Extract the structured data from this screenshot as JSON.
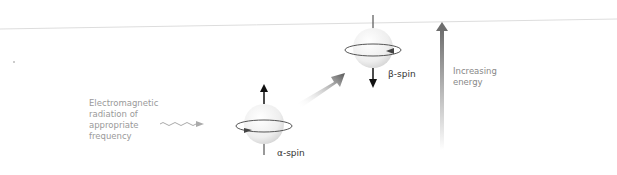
{
  "diagram": {
    "radiation_label": "Electromagnetic radiation of appropriate frequency",
    "radiation_lines": [
      "Electromagnetic",
      "radiation of",
      "appropriate",
      "frequency"
    ],
    "lower_state_label": "α-spin",
    "upper_state_label": "β-spin",
    "energy_axis_lines": [
      "Increasing",
      "energy"
    ],
    "caption_fragment": "",
    "colors": {
      "baseline": "#d9d9d9",
      "sphere_fill": "#f2f2f2",
      "spin_arrow": "#111111",
      "orbit_ring": "#555555",
      "energy_arrow": "#7a7a7a",
      "transition_arrow": "#666666",
      "wave": "#aaaaaa",
      "muted_text": "#9a9a9a"
    },
    "nodes": [
      {
        "id": "alpha-spin",
        "label": "α-spin",
        "spin_direction": "up",
        "level": "lower"
      },
      {
        "id": "beta-spin",
        "label": "β-spin",
        "spin_direction": "down",
        "level": "upper"
      }
    ],
    "edges": [
      {
        "from": "radiation",
        "to": "alpha-spin",
        "style": "wavy-arrow"
      },
      {
        "from": "alpha-spin",
        "to": "beta-spin",
        "style": "thick-gradient-arrow",
        "meaning": "absorption / spin flip"
      }
    ]
  }
}
